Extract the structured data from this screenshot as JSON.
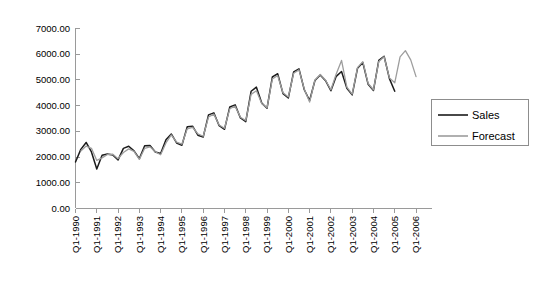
{
  "chart_data": {
    "type": "line",
    "title": "",
    "xlabel": "",
    "ylabel": "",
    "ylim": [
      0,
      7000
    ],
    "ytick_values": [
      0,
      1000,
      2000,
      3000,
      4000,
      5000,
      6000,
      7000
    ],
    "ytick_labels": [
      "0.00",
      "1000.00",
      "2000.00",
      "3000.00",
      "4000.00",
      "5000.00",
      "6000.00",
      "7000.00"
    ],
    "grid": false,
    "legend_position": "right",
    "x_tick_labels": [
      "Q1-1990",
      "Q1-1991",
      "Q1-1992",
      "Q1-1993",
      "Q1-1994",
      "Q1-1995",
      "Q1-1996",
      "Q1-1997",
      "Q1-1998",
      "Q1-1999",
      "Q1-2000",
      "Q1-2001",
      "Q1-2002",
      "Q1-2003",
      "Q1-2004",
      "Q1-2005",
      "Q1-2006"
    ],
    "x_tick_label_rotation": -90,
    "x_periods": [
      "Q1-1990",
      "Q2-1990",
      "Q3-1990",
      "Q4-1990",
      "Q1-1991",
      "Q2-1991",
      "Q3-1991",
      "Q4-1991",
      "Q1-1992",
      "Q2-1992",
      "Q3-1992",
      "Q4-1992",
      "Q1-1993",
      "Q2-1993",
      "Q3-1993",
      "Q4-1993",
      "Q1-1994",
      "Q2-1994",
      "Q3-1994",
      "Q4-1994",
      "Q1-1995",
      "Q2-1995",
      "Q3-1995",
      "Q4-1995",
      "Q1-1996",
      "Q2-1996",
      "Q3-1996",
      "Q4-1996",
      "Q1-1997",
      "Q2-1997",
      "Q3-1997",
      "Q4-1997",
      "Q1-1998",
      "Q2-1998",
      "Q3-1998",
      "Q4-1998",
      "Q1-1999",
      "Q2-1999",
      "Q3-1999",
      "Q4-1999",
      "Q1-2000",
      "Q2-2000",
      "Q3-2000",
      "Q4-2000",
      "Q1-2001",
      "Q2-2001",
      "Q3-2001",
      "Q4-2001",
      "Q1-2002",
      "Q2-2002",
      "Q3-2002",
      "Q4-2002",
      "Q1-2003",
      "Q2-2003",
      "Q3-2003",
      "Q4-2003",
      "Q1-2004",
      "Q2-2004",
      "Q3-2004",
      "Q4-2004",
      "Q1-2005",
      "Q2-2005",
      "Q3-2005",
      "Q4-2005",
      "Q1-2006",
      "Q2-2006",
      "Q3-2006",
      "Q4-2006"
    ],
    "series": [
      {
        "name": "Sales",
        "color": "#1b1b1b",
        "values": [
          1790,
          2280,
          2550,
          2180,
          1520,
          2050,
          2100,
          2060,
          1870,
          2320,
          2400,
          2220,
          1920,
          2420,
          2430,
          2180,
          2120,
          2650,
          2880,
          2530,
          2440,
          3160,
          3180,
          2830,
          2760,
          3620,
          3700,
          3200,
          3060,
          3930,
          4010,
          3500,
          3360,
          4540,
          4700,
          4080,
          3880,
          5100,
          5220,
          4450,
          4280,
          5290,
          5410,
          4600,
          4180,
          4960,
          5170,
          4950,
          4560,
          5120,
          5310,
          4660,
          4400,
          5430,
          5660,
          4810,
          4570,
          5740,
          5900,
          5030,
          4540,
          null,
          null,
          null,
          null,
          null,
          null,
          null
        ]
      },
      {
        "name": "Forecast",
        "color": "#9d9d9d",
        "values": [
          null,
          2220,
          2410,
          2320,
          1850,
          1950,
          2080,
          2090,
          1920,
          2160,
          2300,
          2200,
          1890,
          2320,
          2380,
          2190,
          2070,
          2530,
          2840,
          2560,
          2480,
          3080,
          3140,
          2880,
          2790,
          3540,
          3650,
          3230,
          3100,
          3860,
          3960,
          3530,
          3400,
          4420,
          4560,
          4060,
          3900,
          5020,
          5150,
          4480,
          4320,
          5240,
          5370,
          4620,
          4120,
          4980,
          5190,
          4970,
          4600,
          5210,
          5740,
          4700,
          4430,
          5460,
          5690,
          4840,
          4600,
          5700,
          5880,
          5060,
          4870,
          5880,
          6120,
          5760,
          5110,
          null,
          null,
          null
        ]
      }
    ],
    "legend_entries": [
      {
        "label": "Sales",
        "color": "#1b1b1b"
      },
      {
        "label": "Forecast",
        "color": "#9d9d9d"
      }
    ]
  }
}
